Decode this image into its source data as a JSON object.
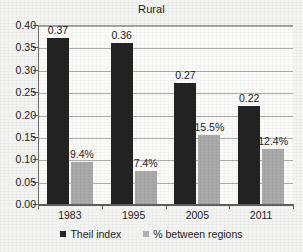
{
  "chart_data": {
    "type": "bar",
    "title": "Rural",
    "xlabel": "",
    "ylabel": "",
    "categories": [
      "1983",
      "1995",
      "2005",
      "2011"
    ],
    "series": [
      {
        "name": "Theil index",
        "color": "#232323",
        "values": [
          0.37,
          0.36,
          0.27,
          0.22
        ],
        "labels": [
          "0.37",
          "0.36",
          "0.27",
          "0.22"
        ]
      },
      {
        "name": "% between regions",
        "color": "#a9a9a9",
        "values": [
          0.094,
          0.074,
          0.155,
          0.124
        ],
        "labels": [
          "9.4%",
          "7.4%",
          "15.5%",
          "12.4%"
        ]
      }
    ],
    "ylim": [
      0.0,
      0.4
    ],
    "ytick_step": 0.05,
    "ytick_labels": [
      "0.00",
      "0.05",
      "0.10",
      "0.15",
      "0.20",
      "0.25",
      "0.30",
      "0.35",
      "0.40"
    ],
    "ytick_values": [
      0.0,
      0.05,
      0.1,
      0.15,
      0.2,
      0.25,
      0.3,
      0.35,
      0.4
    ],
    "grid": true,
    "legend_position": "bottom"
  },
  "legend": {
    "items": [
      {
        "label": "Theil index",
        "marker": "square-dark"
      },
      {
        "label": "% between regions",
        "marker": "square-gray"
      }
    ]
  }
}
